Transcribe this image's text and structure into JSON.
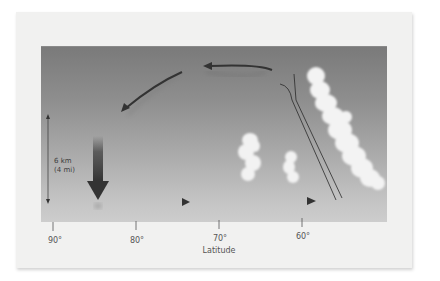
{
  "diagram": {
    "type": "atmospheric-circulation-cross-section",
    "scale_bar": {
      "line1": "6 km",
      "line2": "(4 mi)"
    },
    "x_axis": {
      "title": "Latitude",
      "ticks": [
        {
          "label": "90°",
          "x": 53
        },
        {
          "label": "80°",
          "x": 136
        },
        {
          "label": "70°",
          "x": 219
        },
        {
          "label": "60°",
          "x": 302
        }
      ]
    },
    "elements": {
      "arrows": [
        "upper-westward-arrow",
        "descending-diagonal-arrow",
        "sinking-air-arrow",
        "surface-eastward-arrow-1",
        "surface-eastward-arrow-2"
      ],
      "clouds": [
        "small-cloud-1",
        "small-cloud-2",
        "large-frontal-cloud"
      ],
      "front": "front-boundary-lines"
    },
    "colors": {
      "panel_top": "#7a7a7a",
      "panel_bottom": "#cdcdcd",
      "arrow": "#3a3a3a",
      "cloud": "#f2f2f2"
    }
  }
}
